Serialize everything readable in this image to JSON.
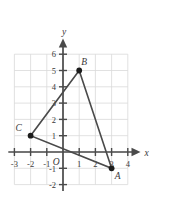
{
  "chart_data": {
    "type": "scatter",
    "title": "",
    "xlabel": "x",
    "ylabel": "y",
    "xlim": [
      -3.5,
      4.6
    ],
    "ylim": [
      -2.4,
      6.9
    ],
    "grid": true,
    "legend": false,
    "origin_label": "O",
    "x_ticks": [
      -3,
      -2,
      -1,
      1,
      2,
      3,
      4
    ],
    "x_tick_labels": [
      "-3",
      "-2",
      "-1",
      "1",
      "2",
      "3",
      "4"
    ],
    "y_ticks": [
      -2,
      -1,
      1,
      2,
      3,
      4,
      5,
      6
    ],
    "y_tick_labels": [
      "-2",
      "-1",
      "1",
      "2",
      "3",
      "4",
      "5",
      "6"
    ],
    "grid_x_range": [
      -3,
      4
    ],
    "grid_y_range": [
      -2,
      6
    ],
    "points": [
      {
        "label": "A",
        "x": 3,
        "y": -1,
        "label_dx": 6,
        "label_dy": 11
      },
      {
        "label": "B",
        "x": 1,
        "y": 5,
        "label_dx": 5,
        "label_dy": -6
      },
      {
        "label": "C",
        "x": -2,
        "y": 1,
        "label_dx": -12,
        "label_dy": -5
      }
    ],
    "polygon": [
      "A",
      "B",
      "C"
    ],
    "shape_name": "triangle ABC",
    "colors": {
      "grid": "#d9d9d9",
      "axis": "#4a4a4a",
      "shape": "#4a4a4a",
      "vertex": "#1c1c1c",
      "text": "#3a3a3a",
      "background": "#ffffff"
    }
  }
}
